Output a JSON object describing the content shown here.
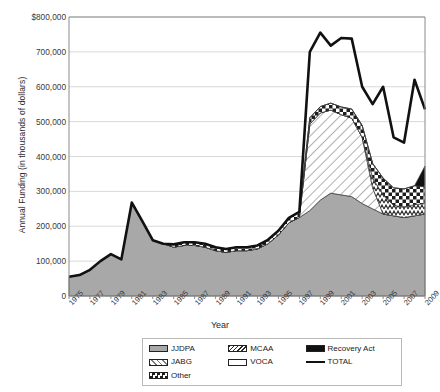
{
  "chart_data": {
    "type": "area",
    "stacked": true,
    "title": "",
    "xlabel": "Year",
    "ylabel": "Annual Funding (in thousands of dollars)",
    "ylim": [
      0,
      800000
    ],
    "ytick_labels": [
      "$800,000",
      "700,000",
      "600,000",
      "500,000",
      "400,000",
      "300,000",
      "200,000",
      "100,000",
      "0"
    ],
    "ytick_values": [
      800000,
      700000,
      600000,
      500000,
      400000,
      300000,
      200000,
      100000,
      0
    ],
    "grid": true,
    "legend_position": "bottom",
    "x": [
      1975,
      1976,
      1977,
      1978,
      1979,
      1980,
      1981,
      1982,
      1983,
      1984,
      1985,
      1986,
      1987,
      1988,
      1989,
      1990,
      1991,
      1992,
      1993,
      1994,
      1995,
      1996,
      1997,
      1998,
      1999,
      2000,
      2001,
      2002,
      2003,
      2004,
      2005,
      2006,
      2007,
      2008,
      2009
    ],
    "xtick_labels": [
      "1975",
      "1977",
      "1979",
      "1981",
      "1983",
      "1985",
      "1987",
      "1989",
      "1991",
      "1993",
      "1995",
      "1997",
      "1999",
      "2001",
      "2003",
      "2005",
      "2007",
      "2009"
    ],
    "xtick_values": [
      1975,
      1977,
      1979,
      1981,
      1983,
      1985,
      1987,
      1989,
      1991,
      1993,
      1995,
      1997,
      1999,
      2001,
      2003,
      2005,
      2007,
      2009
    ],
    "series": [
      {
        "name": "JJDPA",
        "fill": "solid-gray",
        "color": "#a8a8a8",
        "values": [
          55000,
          60000,
          75000,
          100000,
          120000,
          105000,
          268000,
          215000,
          160000,
          150000,
          140000,
          145000,
          145000,
          140000,
          130000,
          125000,
          130000,
          130000,
          135000,
          150000,
          175000,
          210000,
          225000,
          245000,
          275000,
          295000,
          290000,
          285000,
          265000,
          250000,
          235000,
          230000,
          225000,
          230000,
          235000
        ]
      },
      {
        "name": "JABG",
        "fill": "diagonal-hatch-white",
        "color": "#ffffff",
        "values": [
          0,
          0,
          0,
          0,
          0,
          0,
          0,
          0,
          0,
          0,
          0,
          0,
          0,
          0,
          0,
          0,
          0,
          0,
          0,
          0,
          0,
          0,
          0,
          248000,
          250000,
          238000,
          230000,
          225000,
          190000,
          60000,
          0,
          0,
          0,
          0,
          0
        ]
      },
      {
        "name": "MCAA",
        "fill": "zigzag",
        "color": "#cfcfcf",
        "values": [
          0,
          0,
          0,
          0,
          0,
          0,
          0,
          0,
          0,
          0,
          0,
          0,
          0,
          0,
          0,
          0,
          0,
          0,
          0,
          0,
          0,
          0,
          0,
          0,
          0,
          0,
          0,
          0,
          0,
          28000,
          55000,
          30000,
          30000,
          32000,
          30000
        ]
      },
      {
        "name": "VOCA",
        "fill": "white",
        "color": "#ffffff",
        "values": [
          0,
          0,
          0,
          0,
          0,
          0,
          0,
          0,
          0,
          0,
          0,
          0,
          0,
          0,
          0,
          0,
          0,
          0,
          0,
          0,
          0,
          0,
          0,
          0,
          0,
          0,
          0,
          0,
          0,
          0,
          0,
          0,
          0,
          0,
          0
        ]
      },
      {
        "name": "Other",
        "fill": "checker",
        "color": "#ffffff",
        "values": [
          0,
          0,
          0,
          0,
          0,
          0,
          0,
          0,
          0,
          0,
          8000,
          9000,
          9000,
          10000,
          10000,
          10000,
          10000,
          10000,
          10000,
          11000,
          12000,
          14000,
          16000,
          18000,
          18000,
          20000,
          22000,
          26000,
          34000,
          42000,
          48000,
          50000,
          52000,
          54000,
          48000
        ]
      },
      {
        "name": "Recovery Act",
        "fill": "black",
        "color": "#111111",
        "values": [
          0,
          0,
          0,
          0,
          0,
          0,
          0,
          0,
          0,
          0,
          0,
          0,
          0,
          0,
          0,
          0,
          0,
          0,
          0,
          0,
          0,
          0,
          0,
          0,
          0,
          0,
          0,
          0,
          0,
          0,
          0,
          0,
          0,
          0,
          60000
        ]
      }
    ],
    "total_line": {
      "name": "TOTAL",
      "color": "#111111",
      "values": [
        55000,
        60000,
        75000,
        100000,
        120000,
        105000,
        268000,
        215000,
        160000,
        150000,
        148000,
        154000,
        154000,
        150000,
        140000,
        135000,
        140000,
        140000,
        145000,
        161000,
        187000,
        224000,
        241000,
        700000,
        755000,
        718000,
        740000,
        738000,
        600000,
        550000,
        600000,
        455000,
        440000,
        620000,
        535000
      ]
    }
  },
  "legend": {
    "items": [
      {
        "label": "JJDPA",
        "swatch": "solid-gray"
      },
      {
        "label": "MCAA",
        "swatch": "zigzag"
      },
      {
        "label": "Recovery Act",
        "swatch": "black"
      },
      {
        "label": "JABG",
        "swatch": "diagonal-hatch-white"
      },
      {
        "label": "VOCA",
        "swatch": "white"
      },
      {
        "label": "TOTAL",
        "swatch": "line"
      },
      {
        "label": "Other",
        "swatch": "checker"
      }
    ]
  }
}
